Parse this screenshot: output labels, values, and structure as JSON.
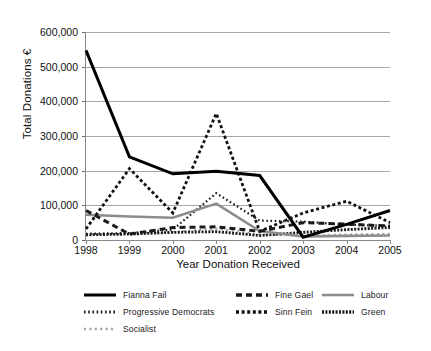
{
  "chart_data": {
    "type": "line",
    "title": "",
    "xlabel": "Year Donation Received",
    "ylabel": "Total Donations €",
    "categories": [
      "1998",
      "1999",
      "2000",
      "2001",
      "2002",
      "2003",
      "2004",
      "2005"
    ],
    "x": [
      1998,
      1999,
      2000,
      2001,
      2002,
      2003,
      2004,
      2005
    ],
    "ylim": [
      0,
      600000
    ],
    "ytick_labels": [
      "0",
      "100,000",
      "200,000",
      "300,000",
      "400,000",
      "500,000",
      "600,000"
    ],
    "ytick_values": [
      0,
      100000,
      200000,
      300000,
      400000,
      500000,
      600000
    ],
    "grid": "horizontal",
    "legend_position": "bottom",
    "series": [
      {
        "name": "Fianna Fail",
        "style": "solid-thick-black",
        "color": "#000000",
        "values": [
          547000,
          240000,
          191000,
          198000,
          186000,
          8000,
          45000,
          85000
        ]
      },
      {
        "name": "Fine Gael",
        "style": "dashed-thick-black",
        "color": "#1a1a1a",
        "values": [
          85000,
          17000,
          36000,
          38000,
          25000,
          50000,
          46000,
          40000
        ]
      },
      {
        "name": "Labour",
        "style": "solid-grey",
        "color": "#8c8c8c",
        "values": [
          73000,
          68000,
          64000,
          105000,
          26000,
          10000,
          12000,
          13000
        ]
      },
      {
        "name": "Progressive Democrats",
        "style": "fine-dotted-black",
        "color": "#1a1a1a",
        "values": [
          18000,
          20000,
          30000,
          135000,
          56000,
          53000,
          44000,
          41000
        ]
      },
      {
        "name": "Sinn Fein",
        "style": "medium-dotted-black",
        "color": "#111111",
        "values": [
          32000,
          206000,
          78000,
          365000,
          25000,
          78000,
          112000,
          50000
        ]
      },
      {
        "name": "Green",
        "style": "tight-dotted-black",
        "color": "#1a1a1a",
        "values": [
          15000,
          17000,
          22000,
          24000,
          13000,
          22000,
          30000,
          36000
        ]
      },
      {
        "name": "Socialist",
        "style": "sparse-dotted-grey",
        "color": "#a0a0a0",
        "values": [
          16000,
          18000,
          23000,
          33000,
          16000,
          12000,
          16000,
          18000
        ]
      }
    ]
  },
  "legend": {
    "items": [
      {
        "label": "Fianna Fail"
      },
      {
        "label": "Fine Gael"
      },
      {
        "label": "Labour"
      },
      {
        "label": "Progressive Democrats"
      },
      {
        "label": "Sinn Fein"
      },
      {
        "label": "Green"
      },
      {
        "label": "Socialist"
      }
    ]
  }
}
